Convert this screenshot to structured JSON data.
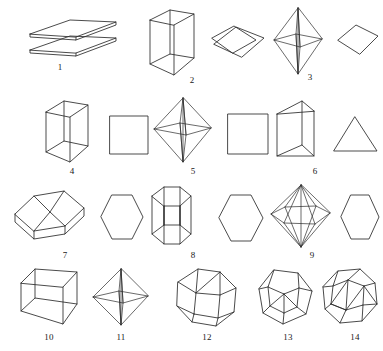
{
  "plate": {
    "title": "Crystal forms plate",
    "background_color": "#ffffff",
    "stroke_color": "#2b2b2b",
    "figure_count": 14
  },
  "figures": [
    {
      "number": "1",
      "name": "pinacoid-two-parallel-planes",
      "kind": "two parallel parallelogram plates",
      "has_cross_section": false,
      "cross_section": ""
    },
    {
      "number": "2",
      "name": "tetragonal-prism",
      "kind": "tall square prism",
      "has_cross_section": true,
      "cross_section": "rhombus"
    },
    {
      "number": "3",
      "name": "tetragonal-dipyramid-elongated",
      "kind": "elongated square bipyramid",
      "has_cross_section": true,
      "cross_section": "rhombus"
    },
    {
      "number": "4",
      "name": "tetragonal-prism-square-section",
      "kind": "tall rectangular prism",
      "has_cross_section": true,
      "cross_section": "square"
    },
    {
      "number": "5",
      "name": "tetragonal-dipyramid",
      "kind": "square bipyramid",
      "has_cross_section": true,
      "cross_section": "square"
    },
    {
      "number": "6",
      "name": "trigonal-prism",
      "kind": "triangular prism",
      "has_cross_section": true,
      "cross_section": "triangle"
    },
    {
      "number": "7",
      "name": "hexagonal-prism-tabular",
      "kind": "flat tabular hexagonal prism",
      "has_cross_section": true,
      "cross_section": "hexagon"
    },
    {
      "number": "8",
      "name": "hexagonal-prism-columnar",
      "kind": "columnar hexagonal prism",
      "has_cross_section": true,
      "cross_section": "hexagon"
    },
    {
      "number": "9",
      "name": "hexagonal-dipyramid",
      "kind": "hexagonal bipyramid",
      "has_cross_section": true,
      "cross_section": "hexagon"
    },
    {
      "number": "10",
      "name": "cube",
      "kind": "cube / hexahedron",
      "has_cross_section": false,
      "cross_section": ""
    },
    {
      "number": "11",
      "name": "octahedron",
      "kind": "octahedron",
      "has_cross_section": false,
      "cross_section": ""
    },
    {
      "number": "12",
      "name": "rhombic-dodecahedron",
      "kind": "rhombic dodecahedron",
      "has_cross_section": false,
      "cross_section": ""
    },
    {
      "number": "13",
      "name": "pentagonal-dodecahedron",
      "kind": "pentagonal dodecahedron",
      "has_cross_section": false,
      "cross_section": ""
    },
    {
      "number": "14",
      "name": "trapezohedron",
      "kind": "trapezohedron / icositetrahedron",
      "has_cross_section": false,
      "cross_section": ""
    }
  ]
}
